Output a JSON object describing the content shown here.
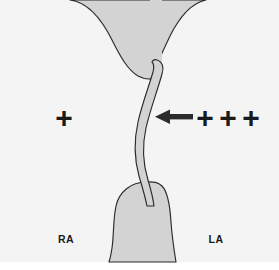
{
  "figure": {
    "background_color": "#f4f4f4",
    "canvas_color": "#ffffff",
    "tissue_fill": "#d3d3d3",
    "tissue_stroke": "#2b2b2b",
    "ink_color": "#1a1a1a"
  },
  "labels": {
    "right_atrium": "RA",
    "left_atrium": "LA"
  },
  "pressure_markers": {
    "right_side": {
      "symbol": "+",
      "count": 1,
      "text": "+"
    },
    "left_side": {
      "symbol": "+",
      "count": 3,
      "items": [
        "+",
        "+",
        "+"
      ]
    }
  },
  "flow_arrow": {
    "name": "leftward-flow-arrow",
    "direction": "left",
    "color": "#2b2b2b"
  },
  "structures": {
    "septum_secundum_superior": "septum-secundum-superior",
    "septum_secundum_inferior": "septum-secundum-inferior",
    "septum_primum_flap": "septum-primum-flap"
  }
}
